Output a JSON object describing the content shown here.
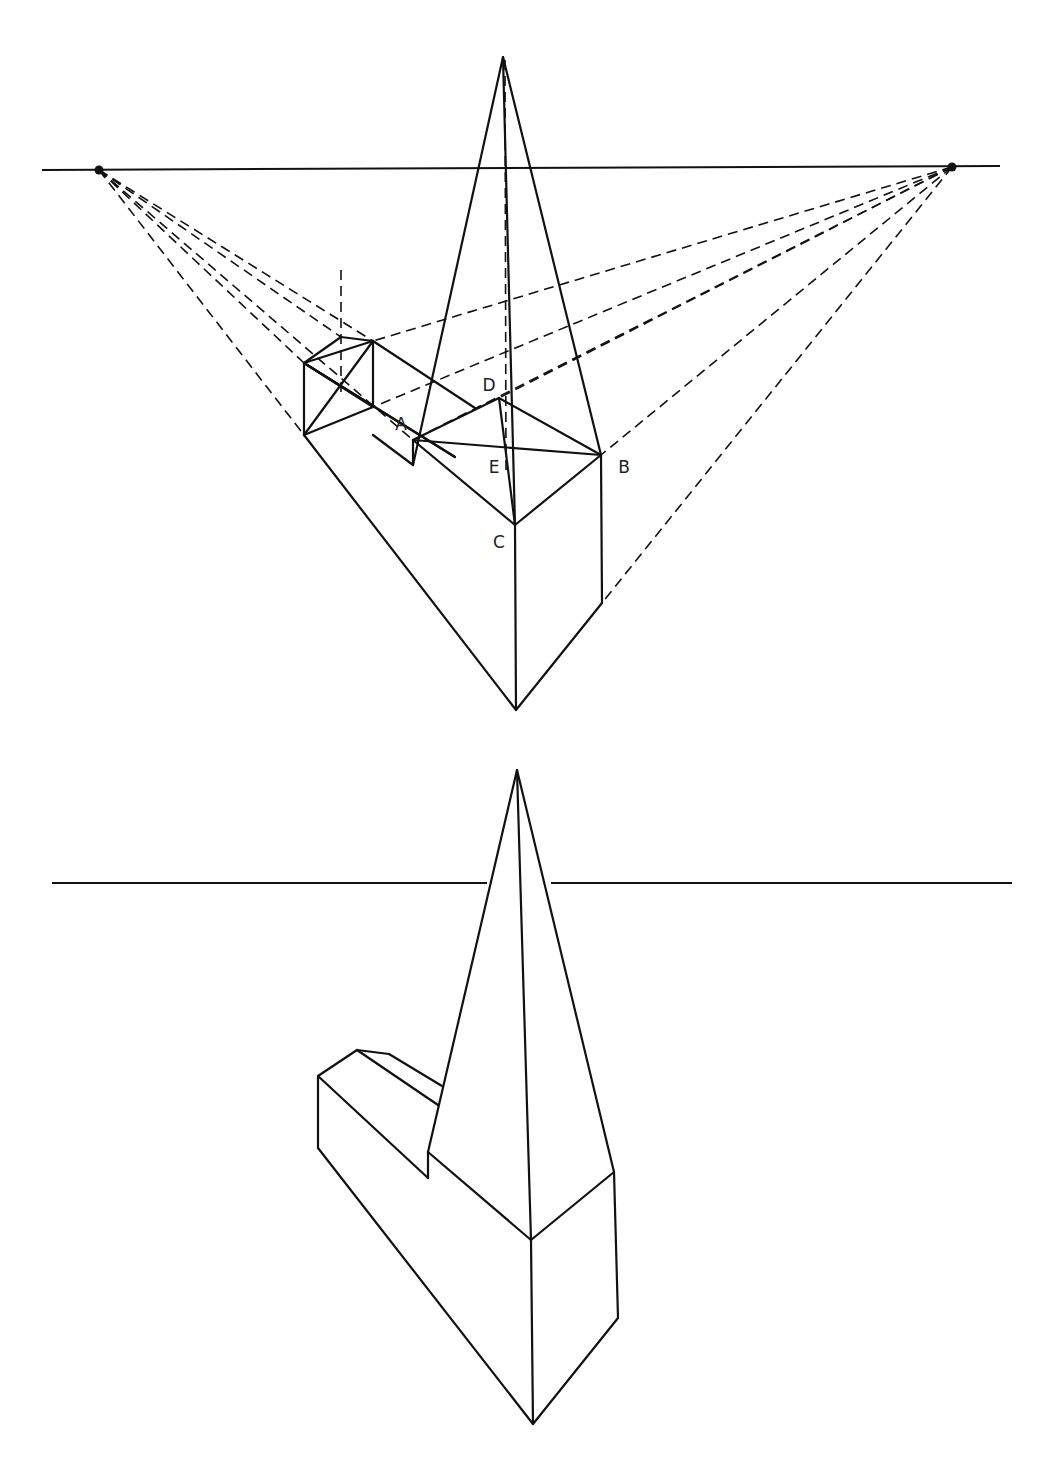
{
  "diagram": {
    "stroke_color": "#111111",
    "background": "#ffffff"
  },
  "labels": [
    {
      "id": "A",
      "text": "A",
      "x": 401,
      "y": 424
    },
    {
      "id": "B",
      "text": "B",
      "x": 624,
      "y": 467
    },
    {
      "id": "C",
      "text": "C",
      "x": 499,
      "y": 542
    },
    {
      "id": "D",
      "text": "D",
      "x": 489,
      "y": 385
    },
    {
      "id": "E",
      "text": "E",
      "x": 494,
      "y": 467
    }
  ],
  "top_figure": {
    "horizon": {
      "x1": 42,
      "y1": 170,
      "x2": 1000,
      "y2": 166
    },
    "vanishing_points": [
      {
        "name": "left-vanishing-point",
        "x": 99,
        "y": 170
      },
      {
        "name": "right-vanishing-point",
        "x": 952,
        "y": 167
      }
    ],
    "solid_lines": [
      [
        503,
        57,
        413,
        465
      ],
      [
        503,
        57,
        601,
        455
      ],
      [
        503,
        57,
        515,
        525
      ],
      [
        413,
        440,
        499,
        398
      ],
      [
        499,
        398,
        601,
        455
      ],
      [
        413,
        440,
        601,
        455
      ],
      [
        413,
        440,
        515,
        525
      ],
      [
        601,
        455,
        515,
        525
      ],
      [
        499,
        398,
        515,
        525
      ],
      [
        413,
        440,
        413,
        465
      ],
      [
        413,
        465,
        373,
        435
      ],
      [
        515,
        525,
        516,
        710
      ],
      [
        601,
        455,
        602,
        603
      ],
      [
        602,
        603,
        516,
        710
      ],
      [
        304,
        435,
        516,
        710
      ],
      [
        304,
        363,
        304,
        435
      ],
      [
        304,
        363,
        341,
        337
      ],
      [
        341,
        337,
        373,
        341
      ],
      [
        373,
        341,
        373,
        407
      ],
      [
        373,
        341,
        475,
        408
      ],
      [
        304,
        363,
        373,
        341
      ],
      [
        304,
        435,
        373,
        341
      ],
      [
        304,
        363,
        373,
        407
      ],
      [
        304,
        435,
        373,
        407
      ],
      [
        304,
        363,
        455,
        457
      ],
      [
        304,
        363,
        455,
        457
      ]
    ],
    "dashed_lines": [
      [
        99,
        170,
        304,
        435
      ],
      [
        99,
        170,
        304,
        363
      ],
      [
        99,
        170,
        341,
        337
      ],
      [
        99,
        170,
        373,
        341
      ],
      [
        99,
        170,
        413,
        440
      ],
      [
        952,
        167,
        373,
        341
      ],
      [
        952,
        167,
        373,
        407
      ],
      [
        952,
        167,
        499,
        398
      ],
      [
        952,
        167,
        413,
        440
      ],
      [
        952,
        167,
        601,
        455
      ],
      [
        952,
        167,
        602,
        603
      ],
      [
        341,
        270,
        341,
        395
      ],
      [
        505,
        60,
        506,
        470
      ]
    ]
  },
  "bottom_figure": {
    "horizon_left": {
      "x1": 52,
      "y1": 883,
      "x2": 487,
      "y2": 883
    },
    "horizon_right": {
      "x1": 551,
      "y1": 883,
      "x2": 1012,
      "y2": 883
    },
    "solid_lines": [
      [
        517,
        770,
        428,
        1152
      ],
      [
        517,
        770,
        614,
        1172
      ],
      [
        517,
        770,
        531,
        1240
      ],
      [
        428,
        1152,
        428,
        1178
      ],
      [
        428,
        1152,
        531,
        1240
      ],
      [
        614,
        1172,
        531,
        1240
      ],
      [
        531,
        1240,
        533,
        1424
      ],
      [
        614,
        1172,
        618,
        1318
      ],
      [
        618,
        1318,
        533,
        1424
      ],
      [
        318,
        1148,
        533,
        1424
      ],
      [
        318,
        1076,
        318,
        1148
      ],
      [
        318,
        1076,
        357,
        1050
      ],
      [
        357,
        1050,
        389,
        1054
      ],
      [
        389,
        1054,
        442,
        1086
      ],
      [
        357,
        1050,
        438,
        1105
      ],
      [
        318,
        1076,
        428,
        1178
      ]
    ]
  }
}
